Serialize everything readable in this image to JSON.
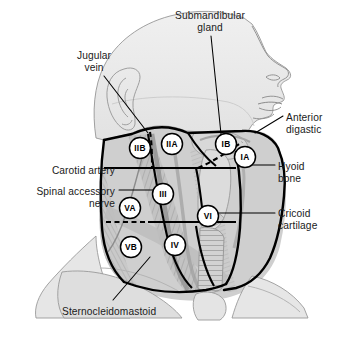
{
  "figure": {
    "background_color": "#ffffff",
    "line_color": "#000000",
    "text_color": "#1a1a1a",
    "skin_tone": "#ebebeb",
    "muscle_tone": "#b4b4b4"
  },
  "labels": [
    {
      "id": "submandibular-gland",
      "text": "Submandibular\ngland",
      "line1": "Submandibular",
      "line2": "gland",
      "align": "center",
      "x": 210,
      "y": 10
    },
    {
      "id": "jugular-vein",
      "text": "Jugular\nvein",
      "line1": "Jugular",
      "line2": "vein",
      "align": "center",
      "x": 94,
      "y": 50
    },
    {
      "id": "anterior-digastric",
      "text": "Anterior\ndigastic",
      "line1": "Anterior",
      "line2": "digastic",
      "align": "left",
      "x": 286,
      "y": 112
    },
    {
      "id": "carotid-artery",
      "text": "Carotid artery",
      "line1": "Carotid artery",
      "line2": "",
      "align": "right",
      "x": 115,
      "y": 165
    },
    {
      "id": "hyoid-bone",
      "text": "Hyoid\nbone",
      "line1": "Hyoid",
      "line2": "bone",
      "align": "left",
      "x": 278,
      "y": 161
    },
    {
      "id": "spinal-accessory-nerve",
      "text": "Spinal accessory\nnerve",
      "line1": "Spinal accessory",
      "line2": "nerve",
      "align": "right",
      "x": 115,
      "y": 186
    },
    {
      "id": "cricoid-cartilage",
      "text": "Cricoid\ncartilage",
      "line1": "Cricoid",
      "line2": "cartilage",
      "align": "left",
      "x": 278,
      "y": 208
    },
    {
      "id": "sternocleidomastoid",
      "text": "Sternocleidomastoid",
      "line1": "Sternocleidomastoid",
      "line2": "",
      "align": "left",
      "x": 62,
      "y": 306
    }
  ],
  "level_markers": [
    {
      "id": "level-IIB",
      "label": "IIB",
      "x": 140,
      "y": 148,
      "r": 10.5
    },
    {
      "id": "level-IIA",
      "label": "IIA",
      "x": 172,
      "y": 144,
      "r": 10.5
    },
    {
      "id": "level-IB",
      "label": "IB",
      "x": 226,
      "y": 144,
      "r": 10.5
    },
    {
      "id": "level-IA",
      "label": "IA",
      "x": 245,
      "y": 157,
      "r": 10.5
    },
    {
      "id": "level-III",
      "label": "III",
      "x": 163,
      "y": 194,
      "r": 10.5
    },
    {
      "id": "level-VA",
      "label": "VA",
      "x": 130,
      "y": 208,
      "r": 10.5
    },
    {
      "id": "level-VI",
      "label": "VI",
      "x": 208,
      "y": 216,
      "r": 10.5
    },
    {
      "id": "level-IV",
      "label": "IV",
      "x": 175,
      "y": 245,
      "r": 10.5
    },
    {
      "id": "level-VB",
      "label": "VB",
      "x": 131,
      "y": 247,
      "r": 10.5
    }
  ],
  "leader_lines": [
    {
      "id": "leader-submandibular-gland",
      "points": "211,36 221,134"
    },
    {
      "id": "leader-jugular-vein",
      "points": "104,76 148,133"
    },
    {
      "id": "leader-anterior-digastric",
      "points": "283,116 255,133"
    },
    {
      "id": "leader-carotid-artery",
      "points": "119,168 172,168"
    },
    {
      "id": "leader-hyoid-bone",
      "points": "275,165 243,165"
    },
    {
      "id": "leader-spinal-accessory-nerve",
      "points": "119,190 160,190"
    },
    {
      "id": "leader-cricoid-cartilage",
      "points": "275,213 216,213"
    },
    {
      "id": "leader-sternocleidomastoid",
      "points": "113,300 150,257"
    }
  ]
}
